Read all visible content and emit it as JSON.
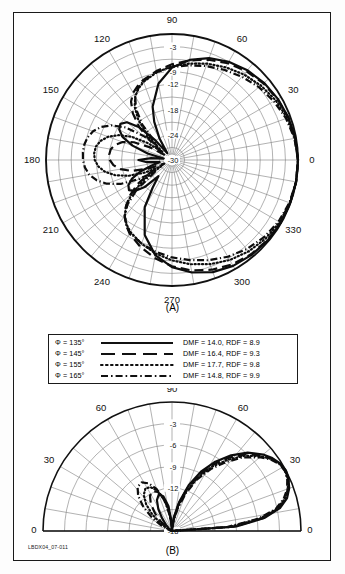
{
  "figure": {
    "doc_id": "LBDX04_07-011",
    "panel_a_caption": "(A)",
    "panel_b_caption": "(B)"
  },
  "legend": {
    "rows": [
      {
        "phi": "Φ = 135°",
        "style": "solid",
        "values": "DMF = 14.0, RDF = 8.9"
      },
      {
        "phi": "Φ = 145°",
        "style": "dashed",
        "values": "DMF = 16.4, RDF = 9.3"
      },
      {
        "phi": "Φ = 155°",
        "style": "dotted",
        "values": "DMF = 17.7, RDF = 9.8"
      },
      {
        "phi": "Φ = 165°",
        "style": "dashdot",
        "values": "DMF = 14.8, RDF = 9.9"
      }
    ]
  },
  "chart_data": [
    {
      "id": "panel-a",
      "type": "line",
      "projection": "polar",
      "title": "(A)",
      "xlabel": "Azimuth angle (degrees)",
      "ylabel": "Relative gain (dB)",
      "grid": true,
      "legend_position": "below",
      "angular_unit": "degrees",
      "angular_ticks": [
        0,
        30,
        60,
        90,
        120,
        150,
        180,
        210,
        240,
        270,
        300,
        330
      ],
      "angular_tick_labels": [
        "0",
        "30",
        "60",
        "90",
        "120",
        "150",
        "180",
        "210",
        "240",
        "270",
        "300",
        "330"
      ],
      "radial_ticks": [
        -3,
        -6,
        -9,
        -12,
        -15,
        -18,
        -21,
        -24,
        -27,
        -30
      ],
      "radial_tick_labels": [
        "-3",
        "-6",
        "-9",
        "-12",
        "-15",
        "-18",
        "-21",
        "-24",
        "-27",
        "-30"
      ],
      "radial_labels_shown": [
        "-3",
        "-9",
        "-12",
        "-18",
        "-24",
        "-30"
      ],
      "rlim": [
        -30,
        0
      ],
      "series": [
        {
          "name": "Φ = 135°",
          "style": "solid",
          "angles": [
            0,
            10,
            20,
            30,
            40,
            50,
            60,
            70,
            80,
            90,
            100,
            110,
            115,
            120,
            125,
            130,
            135,
            140,
            145,
            150,
            155,
            160,
            165,
            170,
            175,
            180,
            185,
            190,
            195,
            200,
            205,
            210,
            215,
            220,
            225,
            230,
            235,
            240,
            250,
            260,
            270,
            280,
            290,
            300,
            310,
            320,
            330,
            340,
            350,
            360
          ],
          "values": [
            0,
            -0.2,
            -0.5,
            -0.9,
            -1.4,
            -2.1,
            -3.0,
            -4.2,
            -5.8,
            -8.0,
            -11.5,
            -16.5,
            -20.0,
            -24.0,
            -28.0,
            -24.0,
            -19.0,
            -16.0,
            -15.0,
            -15.5,
            -17.0,
            -20.0,
            -24.0,
            -28.0,
            -25.0,
            -22.0,
            -24.0,
            -27.0,
            -25.0,
            -22.0,
            -19.5,
            -18.0,
            -17.5,
            -18.5,
            -21.0,
            -25.0,
            -22.0,
            -17.0,
            -11.0,
            -7.0,
            -4.5,
            -2.8,
            -1.6,
            -0.9,
            -0.5,
            -0.25,
            -0.1,
            -0.05,
            0,
            0
          ]
        },
        {
          "name": "Φ = 145°",
          "style": "dashed",
          "angles": [
            0,
            10,
            20,
            30,
            40,
            50,
            60,
            70,
            80,
            90,
            100,
            110,
            115,
            120,
            125,
            130,
            135,
            140,
            145,
            150,
            155,
            160,
            165,
            170,
            175,
            180,
            185,
            190,
            195,
            200,
            205,
            210,
            215,
            220,
            225,
            230,
            235,
            240,
            250,
            260,
            270,
            280,
            290,
            300,
            310,
            320,
            330,
            340,
            350,
            360
          ],
          "values": [
            0,
            -0.2,
            -0.5,
            -1.0,
            -1.6,
            -2.4,
            -3.4,
            -4.6,
            -5.9,
            -7.2,
            -8.5,
            -9.8,
            -10.6,
            -11.5,
            -13.0,
            -15.5,
            -19.0,
            -24.0,
            -28.0,
            -24.0,
            -20.0,
            -17.5,
            -16.0,
            -15.2,
            -15.0,
            -15.2,
            -16.0,
            -17.5,
            -20.0,
            -24.0,
            -28.0,
            -24.0,
            -20.0,
            -17.0,
            -14.5,
            -12.5,
            -11.0,
            -9.8,
            -8.0,
            -6.3,
            -4.7,
            -3.3,
            -2.2,
            -1.3,
            -0.7,
            -0.35,
            -0.15,
            -0.05,
            0,
            0
          ]
        },
        {
          "name": "Φ = 155°",
          "style": "dotted",
          "angles": [
            0,
            10,
            20,
            30,
            40,
            50,
            60,
            70,
            80,
            90,
            100,
            110,
            115,
            120,
            125,
            130,
            135,
            140,
            145,
            150,
            155,
            160,
            165,
            170,
            175,
            180,
            185,
            190,
            195,
            200,
            205,
            210,
            215,
            220,
            225,
            230,
            235,
            240,
            250,
            260,
            270,
            280,
            290,
            300,
            310,
            320,
            330,
            340,
            350,
            360
          ],
          "values": [
            0,
            -0.3,
            -0.8,
            -1.5,
            -2.4,
            -3.4,
            -4.5,
            -5.6,
            -6.7,
            -7.7,
            -8.8,
            -10.2,
            -11.2,
            -12.5,
            -14.5,
            -17.5,
            -22.0,
            -27.0,
            -23.0,
            -19.0,
            -16.0,
            -13.8,
            -12.4,
            -11.6,
            -11.4,
            -11.6,
            -12.4,
            -13.8,
            -16.0,
            -19.0,
            -23.0,
            -27.0,
            -22.0,
            -17.5,
            -14.5,
            -12.5,
            -11.2,
            -10.2,
            -8.8,
            -7.4,
            -6.1,
            -4.8,
            -3.6,
            -2.5,
            -1.6,
            -0.9,
            -0.4,
            -0.15,
            0,
            0
          ]
        },
        {
          "name": "Φ = 165°",
          "style": "dashdot",
          "angles": [
            0,
            10,
            20,
            30,
            40,
            50,
            60,
            70,
            80,
            90,
            100,
            110,
            115,
            120,
            125,
            130,
            135,
            140,
            145,
            150,
            155,
            160,
            165,
            170,
            175,
            180,
            185,
            190,
            195,
            200,
            205,
            210,
            215,
            220,
            225,
            230,
            235,
            240,
            250,
            260,
            270,
            280,
            290,
            300,
            310,
            320,
            330,
            340,
            350,
            360
          ],
          "values": [
            0,
            -0.4,
            -1.1,
            -2.0,
            -3.0,
            -4.1,
            -5.2,
            -6.2,
            -7.1,
            -7.9,
            -8.8,
            -10.0,
            -11.0,
            -12.5,
            -15.0,
            -19.0,
            -25.0,
            -21.0,
            -16.5,
            -13.5,
            -11.4,
            -10.0,
            -9.2,
            -8.8,
            -8.7,
            -8.8,
            -9.2,
            -10.0,
            -11.4,
            -13.5,
            -16.5,
            -21.0,
            -25.0,
            -19.0,
            -15.0,
            -12.5,
            -11.0,
            -10.0,
            -8.8,
            -7.8,
            -6.8,
            -5.8,
            -4.6,
            -3.4,
            -2.3,
            -1.4,
            -0.7,
            -0.25,
            0,
            0
          ]
        }
      ]
    },
    {
      "id": "panel-b",
      "type": "line",
      "projection": "polar-half",
      "title": "(B)",
      "xlabel": "Elevation angle (degrees)",
      "ylabel": "Relative gain (dB)",
      "grid": true,
      "angular_unit": "degrees",
      "angular_ticks": [
        0,
        30,
        60,
        90,
        120,
        150,
        180
      ],
      "angular_tick_labels": [
        "0",
        "30",
        "60",
        "90",
        "60",
        "30",
        "0"
      ],
      "radial_ticks": [
        -3,
        -6,
        -9,
        -12,
        -15,
        -18
      ],
      "radial_tick_labels": [
        "-3",
        "-6",
        "-9",
        "-12",
        "-15",
        "-18"
      ],
      "radial_labels_shown": [
        "-3",
        "-6",
        "-9",
        "-12",
        "-18"
      ],
      "rlim": [
        -18,
        0
      ],
      "series": [
        {
          "name": "Φ = 135°",
          "style": "solid",
          "angles": [
            0,
            4,
            8,
            12,
            16,
            20,
            24,
            28,
            32,
            36,
            40,
            46,
            52,
            58,
            64,
            70,
            76,
            82,
            88,
            90,
            92,
            98,
            104,
            110,
            116,
            122,
            128,
            134,
            140,
            146,
            152,
            158,
            164,
            170,
            176,
            180
          ],
          "values": [
            -18,
            -9.0,
            -5.0,
            -2.6,
            -1.3,
            -0.6,
            -0.2,
            0,
            -0.2,
            -0.7,
            -1.4,
            -2.8,
            -4.6,
            -6.6,
            -8.8,
            -11.2,
            -13.8,
            -16.0,
            -17.6,
            -18,
            -17.0,
            -14.5,
            -13.0,
            -12.6,
            -13.2,
            -14.4,
            -15.8,
            -16.8,
            -17.4,
            -17.8,
            -18,
            -18,
            -18,
            -18,
            -18,
            -18
          ]
        },
        {
          "name": "Φ = 145°",
          "style": "dashed",
          "angles": [
            0,
            4,
            8,
            12,
            16,
            20,
            24,
            28,
            32,
            36,
            40,
            46,
            52,
            58,
            64,
            70,
            76,
            82,
            88,
            90,
            92,
            98,
            104,
            110,
            116,
            122,
            128,
            134,
            140,
            146,
            152,
            158,
            164,
            170,
            176,
            180
          ],
          "values": [
            -18,
            -9.4,
            -5.2,
            -2.8,
            -1.4,
            -0.7,
            -0.25,
            -0.05,
            -0.25,
            -0.8,
            -1.6,
            -3.1,
            -5.0,
            -7.0,
            -9.2,
            -11.6,
            -14.0,
            -16.2,
            -17.7,
            -18,
            -17.2,
            -15.0,
            -13.2,
            -12.2,
            -11.8,
            -12.2,
            -13.2,
            -14.6,
            -16.0,
            -17.0,
            -17.7,
            -18,
            -18,
            -18,
            -18,
            -18
          ]
        },
        {
          "name": "Φ = 155°",
          "style": "dotted",
          "angles": [
            0,
            4,
            8,
            12,
            16,
            20,
            24,
            28,
            32,
            36,
            40,
            46,
            52,
            58,
            64,
            70,
            76,
            82,
            88,
            90,
            92,
            98,
            104,
            110,
            116,
            122,
            128,
            134,
            140,
            146,
            152,
            158,
            164,
            170,
            176,
            180
          ],
          "values": [
            -18,
            -10.0,
            -5.6,
            -3.0,
            -1.6,
            -0.8,
            -0.3,
            -0.1,
            -0.3,
            -0.9,
            -1.8,
            -3.4,
            -5.4,
            -7.4,
            -9.6,
            -12.0,
            -14.4,
            -16.5,
            -17.8,
            -18,
            -17.4,
            -15.4,
            -13.4,
            -12.0,
            -11.2,
            -11.0,
            -11.6,
            -12.8,
            -14.4,
            -16.0,
            -17.2,
            -17.8,
            -18,
            -18,
            -18,
            -18
          ]
        },
        {
          "name": "Φ = 165°",
          "style": "dashdot",
          "angles": [
            0,
            4,
            8,
            12,
            16,
            20,
            24,
            28,
            32,
            36,
            40,
            46,
            52,
            58,
            64,
            70,
            76,
            82,
            88,
            90,
            92,
            98,
            104,
            110,
            116,
            122,
            128,
            134,
            140,
            146,
            152,
            158,
            164,
            170,
            176,
            180
          ],
          "values": [
            -18,
            -10.4,
            -5.9,
            -3.2,
            -1.8,
            -0.9,
            -0.4,
            -0.15,
            -0.35,
            -1.0,
            -2.0,
            -3.7,
            -5.8,
            -7.8,
            -10.0,
            -12.4,
            -14.8,
            -16.8,
            -17.9,
            -18,
            -17.6,
            -15.8,
            -13.6,
            -11.8,
            -10.6,
            -10.0,
            -10.2,
            -11.2,
            -12.8,
            -14.6,
            -16.2,
            -17.4,
            -18,
            -18,
            -18,
            -18
          ]
        }
      ]
    }
  ]
}
